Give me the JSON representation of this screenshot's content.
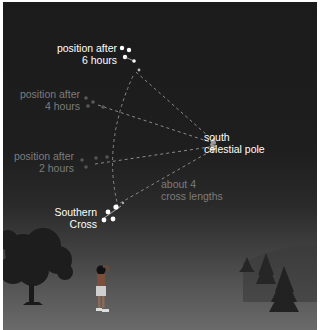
{
  "diagram": {
    "type": "night-sky illustration",
    "colors": {
      "sky_top": "#1b1b1b",
      "ground_bottom": "#6a6a6a",
      "bright_text": "#ffffff",
      "dim_text": "#7c7c7c",
      "star": "#ffffff",
      "dashed_line": "#8a8a8a"
    },
    "labels": {
      "pos6": {
        "line1": "position after",
        "line2": "6 hours"
      },
      "pos4": {
        "line1": "position after",
        "line2": "4 hours"
      },
      "pos2": {
        "line1": "position after",
        "line2": "2 hours"
      },
      "cross": {
        "line1": "Southern",
        "line2": "Cross"
      },
      "pole": {
        "line1": "south",
        "line2": "celestial pole"
      },
      "distance": {
        "line1": "about 4",
        "line2": "cross lengths"
      }
    },
    "icons": [
      "star-icon",
      "tree-icon",
      "pine-tree-icon",
      "person-icon",
      "arrow-icon"
    ]
  }
}
